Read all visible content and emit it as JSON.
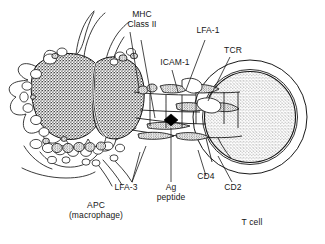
{
  "figure": {
    "background_color": "#ffffff",
    "ink_color": "#161616",
    "style": "black-and-white stippled line drawing"
  },
  "labels": {
    "mhc_class_ii": "MHC\nClass II",
    "icam_1": "ICAM-1",
    "lfa_1": "LFA-1",
    "tcr": "TCR",
    "lfa_3": "LFA-3",
    "ag_peptide": "Ag\npeptide",
    "cd4": "CD4",
    "cd2": "CD2",
    "apc": "APC\n(macrophage)",
    "t_cell": "T cell"
  },
  "cells": [
    {
      "name": "APC (macrophage)",
      "caption": "APC\n(macrophage)",
      "side": "left",
      "features": [
        "pseudopodia",
        "bilobed stippled nucleus",
        "cytoplasmic vesicles",
        "granules"
      ]
    },
    {
      "name": "T cell",
      "caption": "T cell",
      "side": "right",
      "features": [
        "round cell",
        "thin clear cytoplasm rim",
        "large stippled nucleus"
      ]
    }
  ],
  "molecules": [
    {
      "name": "MHC Class II",
      "on_cell": "APC",
      "label_key": "mhc_class_ii"
    },
    {
      "name": "ICAM-1",
      "on_cell": "APC",
      "label_key": "icam_1"
    },
    {
      "name": "LFA-3",
      "on_cell": "APC",
      "label_key": "lfa_3"
    },
    {
      "name": "Ag peptide",
      "on_cell": "APC",
      "label_key": "ag_peptide"
    },
    {
      "name": "LFA-1",
      "on_cell": "T cell",
      "label_key": "lfa_1"
    },
    {
      "name": "TCR",
      "on_cell": "T cell",
      "label_key": "tcr"
    },
    {
      "name": "CD4",
      "on_cell": "T cell",
      "label_key": "cd4"
    },
    {
      "name": "CD2",
      "on_cell": "T cell",
      "label_key": "cd2"
    }
  ]
}
